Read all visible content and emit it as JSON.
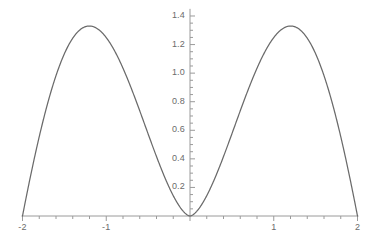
{
  "chart_data": {
    "type": "line",
    "title": "",
    "xlabel": "",
    "ylabel": "",
    "xlim": [
      -2,
      2
    ],
    "ylim": [
      0,
      1.45
    ],
    "grid": false,
    "legend": null,
    "line_color": "#6a6a6a",
    "axis_color": "#9a9a9a",
    "tick_label_color": "#6b6b6b",
    "background_color": "#ffffff",
    "x_ticks": [
      {
        "value": -2,
        "label": "-2"
      },
      {
        "value": -1,
        "label": "-1"
      },
      {
        "value": 0,
        "label": ""
      },
      {
        "value": 1,
        "label": "1"
      },
      {
        "value": 2,
        "label": "2"
      }
    ],
    "y_ticks": [
      {
        "value": 0.2,
        "label": "0.2"
      },
      {
        "value": 0.4,
        "label": "0.4"
      },
      {
        "value": 0.6,
        "label": "0.6"
      },
      {
        "value": 0.8,
        "label": "0.8"
      },
      {
        "value": 1.0,
        "label": "1.0"
      },
      {
        "value": 1.2,
        "label": "1.2"
      },
      {
        "value": 1.4,
        "label": "1.4"
      }
    ],
    "x_minor_tick_step": 0.2,
    "y_minor_tick_step": 0.05,
    "series": [
      {
        "name": "curve",
        "peaks": [
          {
            "x": -1.37,
            "y": 1.33
          },
          {
            "x": 1.37,
            "y": 1.33
          }
        ],
        "zeros": [
          -2,
          0,
          2
        ],
        "x": [
          -2.0,
          -1.95,
          -1.9,
          -1.85,
          -1.8,
          -1.75,
          -1.7,
          -1.65,
          -1.6,
          -1.55,
          -1.5,
          -1.45,
          -1.4,
          -1.35,
          -1.3,
          -1.25,
          -1.2,
          -1.15,
          -1.1,
          -1.05,
          -1.0,
          -0.95,
          -0.9,
          -0.85,
          -0.8,
          -0.75,
          -0.7,
          -0.65,
          -0.6,
          -0.55,
          -0.5,
          -0.45,
          -0.4,
          -0.35,
          -0.3,
          -0.25,
          -0.2,
          -0.15,
          -0.1,
          -0.05,
          0.0,
          0.05,
          0.1,
          0.15,
          0.2,
          0.25,
          0.3,
          0.35,
          0.4,
          0.45,
          0.5,
          0.55,
          0.6,
          0.65,
          0.7,
          0.75,
          0.8,
          0.85,
          0.9,
          0.95,
          1.0,
          1.05,
          1.1,
          1.15,
          1.2,
          1.25,
          1.3,
          1.35,
          1.4,
          1.45,
          1.5,
          1.55,
          1.6,
          1.65,
          1.7,
          1.75,
          1.8,
          1.85,
          1.9,
          1.95,
          2.0
        ],
        "y": [
          0.0,
          0.094,
          0.186,
          0.274,
          0.36,
          0.442,
          0.521,
          0.596,
          0.668,
          0.736,
          0.8,
          0.86,
          0.916,
          0.968,
          1.016,
          1.06,
          1.1,
          1.136,
          1.168,
          1.196,
          1.22,
          1.24,
          1.256,
          1.268,
          1.276,
          1.28,
          1.28,
          1.276,
          1.268,
          1.256,
          1.24,
          1.22,
          1.196,
          1.168,
          1.136,
          1.1,
          1.06,
          1.016,
          0.968,
          0.916,
          0.86,
          0.8,
          0.736,
          0.668,
          0.596,
          0.521,
          0.442,
          0.36,
          0.274,
          0.186,
          0.094,
          0.0,
          0.0,
          0.0,
          0.0,
          0.0,
          0.0,
          0.0,
          0.0,
          0.0,
          0.0,
          0.0,
          0.0,
          0.0,
          0.0,
          0.0,
          0.0,
          0.0,
          0.0,
          0.0,
          0.0,
          0.0,
          0.0,
          0.0,
          0.0,
          0.0,
          0.0,
          0.0,
          0.0,
          0.0,
          0.0
        ],
        "formula_shape": "symmetric double-hump, zero at x=-2, 0, +2, maxima 1.33 at x=+/-1.37"
      }
    ]
  },
  "plot": {
    "axis_origin_px": {
      "x": 190,
      "y": 216
    },
    "px_per_x_unit": 83.75,
    "px_per_y_unit": 142.86
  }
}
